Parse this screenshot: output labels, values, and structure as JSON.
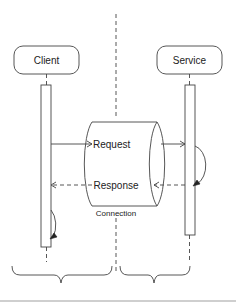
{
  "diagram": {
    "type": "sequence-diagram",
    "participants": [
      {
        "id": "client",
        "label": "Client"
      },
      {
        "id": "service",
        "label": "Service"
      }
    ],
    "messages": [
      {
        "label": "Request",
        "from": "client",
        "to": "service",
        "style": "solid"
      },
      {
        "label": "Response",
        "from": "service",
        "to": "client",
        "style": "dashed"
      }
    ],
    "self_calls": [
      {
        "on": "service",
        "after": "Request"
      },
      {
        "on": "client",
        "after": "Response"
      }
    ],
    "connection": {
      "label": "Connection",
      "shape": "cylinder"
    },
    "groupings": [
      {
        "name": "left-brace",
        "covers": "client"
      },
      {
        "name": "right-brace",
        "covers": "service"
      }
    ],
    "colors": {
      "stroke": "#444444",
      "background": "#ffffff"
    }
  }
}
